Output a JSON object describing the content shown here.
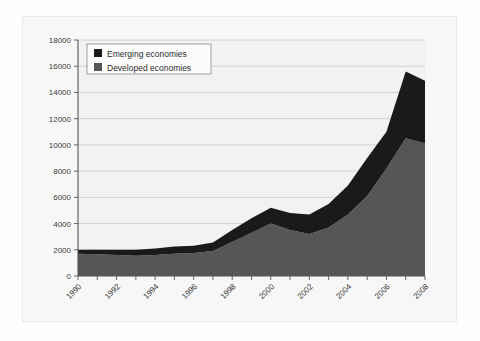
{
  "chart_data": {
    "type": "area",
    "stacked": true,
    "title": "",
    "subtitle": "",
    "xlabel": "",
    "ylabel": "",
    "grid": true,
    "legend_position": "top-left",
    "xlim": [
      1990,
      2008
    ],
    "ylim": [
      0,
      18000
    ],
    "ytick_step": 2000,
    "ytick_labels": [
      "0",
      "2000",
      "4000",
      "6000",
      "8000",
      "10000",
      "12000",
      "14000",
      "16000",
      "18000"
    ],
    "ytick_values": [
      0,
      2000,
      4000,
      6000,
      8000,
      10000,
      12000,
      14000,
      16000,
      18000
    ],
    "x": [
      1990,
      1991,
      1992,
      1993,
      1994,
      1995,
      1996,
      1997,
      1998,
      1999,
      2000,
      2001,
      2002,
      2003,
      2004,
      2005,
      2006,
      2007,
      2008
    ],
    "xtick_values": [
      1990,
      1991,
      1992,
      1993,
      1994,
      1995,
      1996,
      1997,
      1998,
      1999,
      2000,
      2001,
      2002,
      2003,
      2004,
      2005,
      2006,
      2007,
      2008
    ],
    "xtick_labels": [
      "1990",
      "",
      "1992",
      "",
      "1994",
      "",
      "1996",
      "",
      "1998",
      "",
      "2000",
      "",
      "2002",
      "",
      "2004",
      "",
      "2006",
      "",
      "2008"
    ],
    "xtick_labels_shown": [
      "1990",
      "1992",
      "1994",
      "1996",
      "1998",
      "2000",
      "2002",
      "2004",
      "2006",
      "2008"
    ],
    "series": [
      {
        "name": "Developed economies",
        "color": "#565656",
        "values": [
          1700,
          1650,
          1600,
          1550,
          1600,
          1700,
          1750,
          1900,
          2600,
          3300,
          4000,
          3500,
          3200,
          3700,
          4700,
          6100,
          8200,
          10500,
          10100
        ]
      },
      {
        "name": "Emerging economies",
        "color": "#1a1a1a",
        "values": [
          300,
          350,
          400,
          450,
          500,
          550,
          550,
          650,
          900,
          1100,
          1200,
          1300,
          1500,
          1800,
          2200,
          2900,
          2800,
          5100,
          4800
        ]
      }
    ],
    "totals": [
      2000,
      2000,
      2000,
      2000,
      2100,
      2250,
      2300,
      2550,
      3500,
      4400,
      5200,
      4800,
      4700,
      5500,
      6900,
      9000,
      11000,
      15600,
      14900
    ]
  },
  "legend": {
    "items": [
      {
        "label": "Emerging economies",
        "color": "#1a1a1a"
      },
      {
        "label": "Developed economies",
        "color": "#565656"
      }
    ]
  },
  "colors": {
    "emerging": "#1a1a1a",
    "developed": "#565656",
    "grid": "#c9c9c9",
    "axis": "#555555",
    "plot_background": "#f2f2f2",
    "card_background": "#f7f7f7",
    "page_background": "#fdfdfd"
  }
}
